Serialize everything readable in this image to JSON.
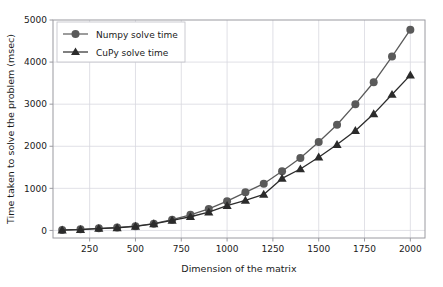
{
  "chart_data": {
    "type": "line",
    "title": "",
    "xlabel": "Dimension of the matrix",
    "ylabel": "Time taken to solve the problem (msec)",
    "x": [
      100,
      200,
      300,
      400,
      500,
      600,
      700,
      800,
      900,
      1000,
      1100,
      1200,
      1300,
      1400,
      1500,
      1600,
      1700,
      1800,
      1900,
      2000
    ],
    "series": [
      {
        "name": "Numpy solve time",
        "marker": "circle",
        "color": "#5a5a5a",
        "values": [
          10,
          25,
          50,
          70,
          100,
          160,
          255,
          370,
          510,
          695,
          905,
          1110,
          1405,
          1720,
          2100,
          2510,
          3000,
          3520,
          4130,
          4770
        ]
      },
      {
        "name": "CuPy solve time",
        "marker": "triangle",
        "color": "#2b2b2b",
        "values": [
          8,
          20,
          45,
          62,
          95,
          155,
          240,
          325,
          435,
          590,
          715,
          855,
          1235,
          1460,
          1740,
          2040,
          2370,
          2770,
          3230,
          3690
        ]
      }
    ],
    "xlim": [
      50,
      2080
    ],
    "ylim": [
      -180,
      5000
    ],
    "xticks": [
      250,
      500,
      750,
      1000,
      1250,
      1500,
      1750,
      2000
    ],
    "xtick_labels": [
      "250",
      "500",
      "750",
      "1000",
      "1250",
      "1500",
      "1750",
      "2000"
    ],
    "yticks": [
      0,
      1000,
      2000,
      3000,
      4000,
      5000
    ],
    "ytick_labels": [
      "0",
      "1000",
      "2000",
      "3000",
      "4000",
      "5000"
    ],
    "grid": true,
    "grid_color": "#d8d8e0",
    "legend_position": "upper left",
    "background": "#ffffff",
    "axis_color": "#9a9aa0"
  },
  "legend": {
    "entries": [
      {
        "label": "Numpy solve time"
      },
      {
        "label": "CuPy solve time"
      }
    ]
  }
}
